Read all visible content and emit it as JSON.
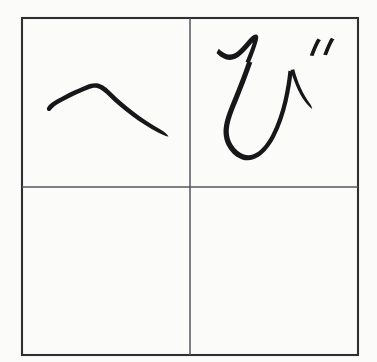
{
  "worksheet": {
    "title": "Hiragana handwriting practice grid",
    "description": "Scanned handwriting worksheet with a 2x2 practice grid",
    "background_color": "#fbfbfa",
    "ink_color": "#17171a",
    "frame_color": "#2f2f33",
    "divider_color": "#55555c",
    "width": 377,
    "height": 362
  },
  "grid": {
    "rows": 2,
    "columns": 2,
    "frame": {
      "x": 22,
      "y": 18,
      "width": 336,
      "height": 337
    },
    "divider_x": 190,
    "divider_y": 187,
    "cells": [
      {
        "id": "cell-top-left",
        "position": "top-left",
        "row": 1,
        "column": 1,
        "filled": true,
        "character": "へ",
        "romaji": "he",
        "stroke_count": 1
      },
      {
        "id": "cell-top-right",
        "position": "top-right",
        "row": 1,
        "column": 2,
        "filled": true,
        "character": "び",
        "romaji": "bi",
        "stroke_count": 3
      },
      {
        "id": "cell-bottom-left",
        "position": "bottom-left",
        "row": 2,
        "column": 1,
        "filled": false,
        "character": "",
        "romaji": "",
        "stroke_count": 0
      },
      {
        "id": "cell-bottom-right",
        "position": "bottom-right",
        "row": 2,
        "column": 2,
        "filled": false,
        "character": "",
        "romaji": "",
        "stroke_count": 0
      }
    ]
  },
  "strokes": {
    "he_main": "M 50.5 110.5 C 52.5 108.0 54.5 106.0 57.0 104.5 C 66.0 99.0 78.0 93.5 88.0 89.5 C 91.5 88.1 94.5 87.4 97.0 88.0 C 100.5 88.8 104.5 92.0 109.5 97.0 C 121.0 108.5 140.0 123.0 158.0 132.5 C 162.5 134.9 166.0 136.2 168.5 136.6 C 167.2 134.0 164.5 131.9 160.5 129.6 C 142.5 119.4 124.0 105.0 112.5 93.5 C 107.0 88.0 102.5 84.6 98.2 83.6 C 94.2 82.7 90.2 83.7 85.8 85.5 C 75.5 89.7 63.0 95.6 53.5 101.6 C 50.3 103.6 48.2 105.6 47.2 107.6 C 46.6 108.8 46.8 109.9 47.6 110.6 C 48.4 111.3 49.5 111.3 50.5 110.5 Z",
    "bi_hook": "M 216.5 53.0 C 219.0 55.8 222.0 58.0 225.5 59.2 C 229.0 60.4 232.5 60.2 235.8 58.6 C 239.5 56.8 243.0 53.6 246.5 49.6 C 249.0 46.7 251.2 44.0 253.0 42.2 C 252.0 45.4 250.4 49.6 248.6 54.2 C 247.4 57.3 246.4 59.8 245.6 61.8 L 249.5 63.4 C 250.6 60.9 251.8 57.9 253.2 54.2 C 255.4 48.4 257.2 43.2 258.0 39.5 C 258.5 37.2 258.2 35.6 257.0 34.8 C 255.6 33.9 253.8 34.6 251.6 36.5 C 249.2 38.6 246.4 42.0 243.4 45.5 C 240.2 49.2 237.2 52.0 234.2 53.5 C 231.6 54.8 229.0 54.9 226.4 54.0 C 223.6 53.0 221.0 51.1 218.8 48.8 Z",
    "bi_body": "M 247.2 61.5 C 243.0 73.5 238.0 86.5 233.5 97.5 C 229.0 108.5 225.6 117.0 224.2 124.5 C 222.6 133.0 223.8 140.6 228.0 147.5 C 231.6 153.4 236.6 157.6 242.0 159.4 C 247.8 161.3 253.6 160.2 259.0 156.6 C 265.0 152.6 270.4 145.8 275.0 137.0 C 280.4 126.7 284.6 114.2 287.6 101.5 C 290.2 90.5 291.8 80.0 292.6 71.5 L 288.4 70.8 C 287.6 79.2 286.0 89.4 283.5 100.2 C 280.6 112.6 276.6 124.6 271.5 134.4 C 267.2 142.6 262.4 148.8 257.2 152.2 C 252.8 155.1 248.4 155.9 244.0 154.4 C 239.6 153.0 235.4 149.4 232.4 144.4 C 229.0 138.7 228.0 132.4 229.4 125.0 C 230.7 118.1 233.9 110.0 238.4 99.2 C 243.0 88.0 248.0 74.8 252.3 62.6 Z",
    "bi_tail": "M 290.5 70.0 C 292.6 77.0 295.0 83.5 297.8 89.4 C 300.6 95.3 303.8 100.4 307.4 104.5 C 309.4 106.8 311.0 108.2 312.2 108.9 C 312.0 107.2 311.2 105.4 309.6 103.2 C 306.4 98.8 303.4 93.7 300.8 88.0 C 298.2 82.3 296.0 76.0 294.2 69.2 Z",
    "dakuten_left": "M 313.5 56.0 C 315.0 52.0 317.0 47.0 319.0 43.2 C 319.8 41.6 320.5 40.6 321.0 40.2 L 317.6 38.6 C 316.8 39.6 316.0 41.0 315.0 43.0 C 313.0 47.0 311.0 52.0 309.8 55.6 Z",
    "dakuten_right": "M 327.0 55.2 C 328.5 51.2 330.5 46.2 332.5 42.4 C 333.3 40.8 334.0 39.8 334.5 39.4 L 331.1 37.8 C 330.3 38.8 329.5 40.2 328.5 42.2 C 326.5 46.2 324.5 51.2 323.3 54.8 Z"
  }
}
